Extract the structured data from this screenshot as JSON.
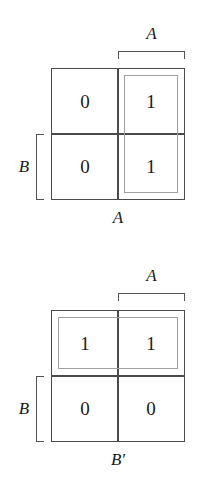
{
  "figure": {
    "type": "karnaugh-map-pair",
    "background_color": "#ffffff",
    "grid_line_color": "#4a4a4a",
    "group_line_color": "#a0a0a0",
    "text_color": "#1a1a1a"
  },
  "maps": [
    {
      "id": "kmap-1",
      "top_bracket_label": "A",
      "left_bracket_label": "B",
      "bottom_caption": "A",
      "cells": [
        {
          "row": 0,
          "col": 0,
          "value": "0"
        },
        {
          "row": 0,
          "col": 1,
          "value": "1"
        },
        {
          "row": 1,
          "col": 0,
          "value": "0"
        },
        {
          "row": 1,
          "col": 1,
          "value": "1"
        }
      ],
      "group": {
        "name": "group-a",
        "orientation": "vertical",
        "covers": "right-column",
        "cells": [
          "r0c1",
          "r1c1"
        ]
      }
    },
    {
      "id": "kmap-2",
      "top_bracket_label": "A",
      "left_bracket_label": "B",
      "bottom_caption": "B′",
      "cells": [
        {
          "row": 0,
          "col": 0,
          "value": "1"
        },
        {
          "row": 0,
          "col": 1,
          "value": "1"
        },
        {
          "row": 1,
          "col": 0,
          "value": "0"
        },
        {
          "row": 1,
          "col": 1,
          "value": "0"
        }
      ],
      "group": {
        "name": "group-b",
        "orientation": "horizontal",
        "covers": "top-row",
        "cells": [
          "r0c0",
          "r0c1"
        ]
      }
    }
  ]
}
